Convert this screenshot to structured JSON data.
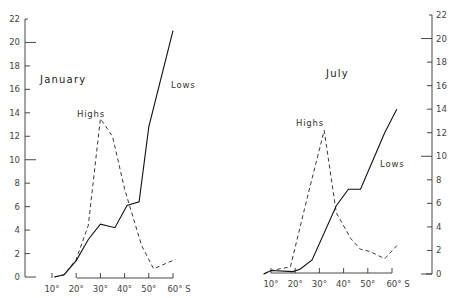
{
  "chart_data": [
    {
      "type": "line",
      "title": "January",
      "xlabel": "Latitude (°S)",
      "ylabel": "",
      "x_ticks": [
        "10°",
        "20°",
        "30°",
        "40°",
        "50°",
        "60° S"
      ],
      "y_ticks": [
        0,
        2,
        4,
        6,
        8,
        10,
        12,
        14,
        16,
        18,
        20,
        22
      ],
      "xlim": [
        10,
        60
      ],
      "ylim": [
        0,
        22
      ],
      "y_axis_side": "left",
      "grid": false,
      "series": [
        {
          "name": "Highs",
          "style": "dashed",
          "x": [
            11,
            15,
            20,
            25,
            30,
            35,
            40,
            47,
            52,
            61
          ],
          "values": [
            0,
            0.2,
            1.5,
            4.4,
            13.5,
            12.0,
            7.5,
            2.7,
            0.7,
            1.5
          ]
        },
        {
          "name": "Lows",
          "style": "solid",
          "x": [
            11,
            15,
            20,
            25,
            30,
            36,
            41,
            46,
            50,
            60
          ],
          "values": [
            0,
            0.2,
            1.4,
            3.2,
            4.5,
            4.2,
            6.1,
            6.4,
            12.8,
            21.0
          ]
        }
      ]
    },
    {
      "type": "line",
      "title": "July",
      "xlabel": "Latitude (°S)",
      "ylabel": "",
      "x_ticks": [
        "10°",
        "20°",
        "30°",
        "40°",
        "50°",
        "60° S"
      ],
      "y_ticks": [
        0,
        2,
        4,
        6,
        8,
        10,
        12,
        14,
        16,
        18,
        20,
        22
      ],
      "xlim": [
        10,
        60
      ],
      "ylim": [
        0,
        22
      ],
      "y_axis_side": "right",
      "grid": false,
      "series": [
        {
          "name": "Highs",
          "style": "dashed",
          "x": [
            7,
            10,
            18,
            25,
            32,
            37,
            43,
            47,
            51,
            57,
            62
          ],
          "values": [
            0,
            0.3,
            0.6,
            6.5,
            12.2,
            5.2,
            3.0,
            2.1,
            1.9,
            1.3,
            2.4
          ]
        },
        {
          "name": "Lows",
          "style": "solid",
          "x": [
            7,
            10,
            19,
            22,
            27,
            37,
            42,
            47,
            57,
            62
          ],
          "values": [
            0,
            0.3,
            0.2,
            0.4,
            1.2,
            5.8,
            7.2,
            7.2,
            12.0,
            14.0
          ]
        }
      ]
    }
  ],
  "labels": {
    "january_title": "January",
    "july_title": "July",
    "highs": "Highs",
    "lows": "Lows"
  }
}
